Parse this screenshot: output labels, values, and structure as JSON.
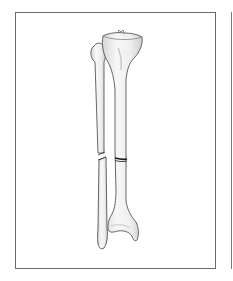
{
  "figure": {
    "bones": [
      {
        "name": "tibia",
        "fracture": "transverse mid-shaft"
      },
      {
        "name": "fibula",
        "fracture": "oblique mid-shaft"
      }
    ],
    "colors": {
      "frame_border": "#6a6a6a",
      "bone_fill": "#f2f2f2",
      "bone_shade": "#d8d8d8",
      "bone_outline": "#555555",
      "fracture_line": "#1a1a1a",
      "background": "#ffffff"
    }
  }
}
